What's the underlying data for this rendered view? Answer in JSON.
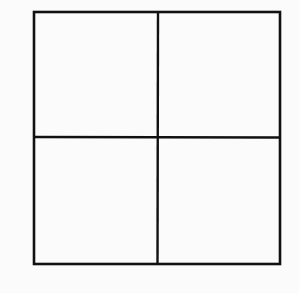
{
  "diagram": {
    "type": "grid",
    "rows": 2,
    "cols": 2,
    "cells": [
      {
        "row": 0,
        "col": 0,
        "label": ""
      },
      {
        "row": 0,
        "col": 1,
        "label": ""
      },
      {
        "row": 1,
        "col": 0,
        "label": ""
      },
      {
        "row": 1,
        "col": 1,
        "label": ""
      }
    ],
    "colors": {
      "background": "#fbfbfb",
      "line": "#111111"
    }
  }
}
